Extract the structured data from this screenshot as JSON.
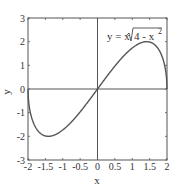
{
  "chart_data": {
    "type": "line",
    "title": "",
    "annotation": "y = x√(4 - x²)",
    "annotation_parts": {
      "prefix": "y = x",
      "radicand": "4 - x",
      "exp": "2"
    },
    "xlabel": "x",
    "ylabel": "y",
    "xlim": [
      -2,
      2
    ],
    "ylim": [
      -3,
      3
    ],
    "xticks": [
      -2,
      -1.5,
      -1,
      -0.5,
      0,
      0.5,
      1,
      1.5,
      2
    ],
    "xtick_labels": [
      "-2",
      "-1.5",
      "-1",
      "-0.5",
      "0",
      "0.5",
      "1",
      "1.5",
      "2"
    ],
    "yticks": [
      -3,
      -2,
      -1,
      0,
      1,
      2,
      3
    ],
    "ytick_labels": [
      "-3",
      "-2",
      "-1",
      "0",
      "1",
      "2",
      "3"
    ],
    "grid": false,
    "legend": null,
    "series": [
      {
        "name": "y = x*sqrt(4 - x^2)",
        "x": [
          -2,
          -1.99,
          -1.95,
          -1.9,
          -1.8,
          -1.7,
          -1.6,
          -1.5,
          -1.414,
          -1.3,
          -1.2,
          -1.0,
          -0.8,
          -0.6,
          -0.4,
          -0.2,
          0,
          0.2,
          0.4,
          0.6,
          0.8,
          1.0,
          1.2,
          1.3,
          1.414,
          1.5,
          1.6,
          1.7,
          1.8,
          1.9,
          1.95,
          1.99,
          2
        ],
        "y": [
          0,
          -0.398,
          -0.866,
          -1.187,
          -1.569,
          -1.791,
          -1.92,
          -1.984,
          -2.0,
          -1.976,
          -1.92,
          -1.732,
          -1.466,
          -1.145,
          -0.784,
          -0.398,
          0,
          0.398,
          0.784,
          1.145,
          1.466,
          1.732,
          1.92,
          1.976,
          2.0,
          1.984,
          1.92,
          1.791,
          1.569,
          1.187,
          0.866,
          0.398,
          0
        ]
      }
    ]
  },
  "style": {
    "line_color": "#555555",
    "axis_color": "#555555",
    "text_color": "#333333"
  }
}
